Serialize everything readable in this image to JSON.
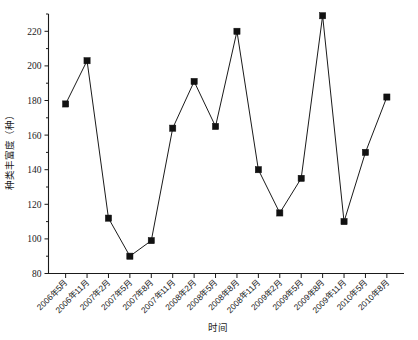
{
  "chart_data": {
    "type": "line",
    "title": "",
    "xlabel": "时间",
    "ylabel": "种类丰富度（种）",
    "ylim": [
      80,
      230
    ],
    "yticks": [
      80,
      100,
      120,
      140,
      160,
      180,
      200,
      220
    ],
    "grid": false,
    "legend": null,
    "marker": "filled-square",
    "categories": [
      "2006年5月",
      "2006年11月",
      "2007年2月",
      "2007年5月",
      "2007年8月",
      "2007年11月",
      "2008年2月",
      "2008年5月",
      "2008年8月",
      "2008年11月",
      "2009年2月",
      "2009年5月",
      "2009年8月",
      "2009年11月",
      "2010年5月",
      "2010年8月"
    ],
    "values": [
      178,
      203,
      112,
      90,
      99,
      164,
      191,
      165,
      220,
      140,
      115,
      135,
      229,
      110,
      150,
      182
    ]
  },
  "axes": {
    "y_tick_labels": [
      "80",
      "100",
      "120",
      "140",
      "160",
      "180",
      "200",
      "220"
    ],
    "y_axis_title": "种类丰富度（种）",
    "x_axis_title": "时间"
  },
  "colors": {
    "line": "#1a1a1a",
    "marker": "#111111",
    "axis": "#1a1a1a",
    "background": "#ffffff"
  }
}
